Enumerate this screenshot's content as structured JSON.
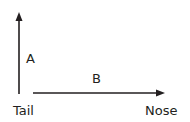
{
  "diagram": {
    "vectors": [
      {
        "id": "A",
        "label": "A",
        "direction": "up"
      },
      {
        "id": "B",
        "label": "B",
        "direction": "right"
      }
    ],
    "endpoints": {
      "tail": "Tail",
      "nose": "Nose"
    },
    "stroke_color": "#231f20"
  }
}
